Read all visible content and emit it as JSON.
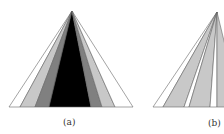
{
  "figures": [
    {
      "id": "a",
      "caption": "(a)",
      "apex": [
        72,
        11
      ],
      "base_y": 107,
      "bands": [
        {
          "x0": 9,
          "x1": 20,
          "fill": "#ffffff"
        },
        {
          "x0": 20,
          "x1": 35,
          "fill": "#c8c8c8"
        },
        {
          "x0": 35,
          "x1": 49,
          "fill": "#808080"
        },
        {
          "x0": 49,
          "x1": 91,
          "fill": "#000000"
        },
        {
          "x0": 91,
          "x1": 102,
          "fill": "#808080"
        },
        {
          "x0": 102,
          "x1": 115,
          "fill": "#c8c8c8"
        },
        {
          "x0": 115,
          "x1": 133,
          "fill": "#ffffff"
        }
      ],
      "outline": "#666666"
    },
    {
      "id": "b",
      "caption": "(b)",
      "apex": [
        217,
        12
      ],
      "base_y": 107,
      "bands": [
        {
          "x0": 153,
          "x1": 163,
          "fill": "#ffffff"
        },
        {
          "x0": 163,
          "x1": 184,
          "fill": "#c8c8c8"
        },
        {
          "x0": 184,
          "x1": 189,
          "fill": "#ffffff"
        },
        {
          "x0": 189,
          "x1": 210,
          "fill": "#c8c8c8"
        },
        {
          "x0": 210,
          "x1": 217,
          "fill": "#ffffff"
        },
        {
          "x0": 217,
          "x1": 240,
          "fill": "#c8c8c8"
        }
      ],
      "outline": "#666666"
    }
  ],
  "labels": {
    "a": "(a)",
    "b": "(b)"
  }
}
